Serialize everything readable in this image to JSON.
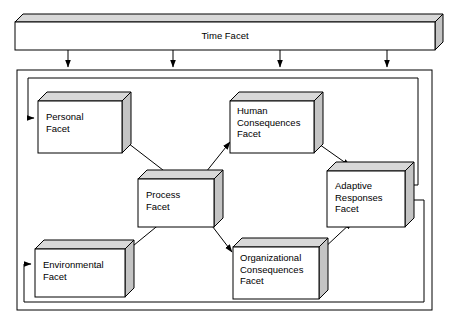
{
  "diagram": {
    "title": "Time Facet",
    "type": "block-diagram",
    "time_bar": {
      "label": "Time Facet",
      "x": 15,
      "y": 14,
      "w": 420,
      "h": 28,
      "depth": 8
    },
    "container": {
      "name": "outer-frame",
      "x": 17,
      "y": 70,
      "w": 415,
      "h": 240
    },
    "boxes": [
      {
        "id": "personal-facet",
        "label": "Personal\nFacet",
        "lines": [
          "Personal",
          "Facet"
        ],
        "x": 38,
        "y": 92,
        "w": 84,
        "h": 52,
        "depth": 9
      },
      {
        "id": "human-consequences-facet",
        "label": "Human\nConsequences\nFacet",
        "lines": [
          "Human",
          "Consequences",
          "Facet"
        ],
        "x": 230,
        "y": 92,
        "w": 84,
        "h": 52,
        "depth": 9
      },
      {
        "id": "process-facet",
        "label": "Process\nFacet",
        "lines": [
          "Process",
          "Facet"
        ],
        "x": 138,
        "y": 170,
        "w": 76,
        "h": 48,
        "depth": 9
      },
      {
        "id": "adaptive-responses-facet",
        "label": "Adaptive\nResponses\nFacet",
        "lines": [
          "Adaptive",
          "Responses",
          "Facet"
        ],
        "x": 327,
        "y": 162,
        "w": 78,
        "h": 56,
        "depth": 9
      },
      {
        "id": "environmental-facet",
        "label": "Environmental\nFacet",
        "lines": [
          "Environmental",
          "Facet"
        ],
        "x": 35,
        "y": 240,
        "w": 90,
        "h": 48,
        "depth": 9
      },
      {
        "id": "organizational-consequences-facet",
        "label": "Organizational\nConsequences\nFacet",
        "lines": [
          "Organizational",
          "Consequences",
          "Facet"
        ],
        "x": 233,
        "y": 238,
        "w": 86,
        "h": 52,
        "depth": 9
      }
    ],
    "time_arrows": [
      {
        "name": "time-arrow-1",
        "x": 68
      },
      {
        "name": "time-arrow-2",
        "x": 173
      },
      {
        "name": "time-arrow-3",
        "x": 280
      },
      {
        "name": "time-arrow-4",
        "x": 387
      }
    ],
    "connections": [
      {
        "name": "personal-to-process",
        "from": "personal-facet",
        "to": "process-facet"
      },
      {
        "name": "environmental-to-process",
        "from": "environmental-facet",
        "to": "process-facet"
      },
      {
        "name": "process-to-human-consequences",
        "from": "process-facet",
        "to": "human-consequences-facet"
      },
      {
        "name": "process-to-organizational-consequences",
        "from": "process-facet",
        "to": "organizational-consequences-facet"
      },
      {
        "name": "human-consequences-to-adaptive-responses",
        "from": "human-consequences-facet",
        "to": "adaptive-responses-facet"
      },
      {
        "name": "organizational-consequences-to-adaptive-responses",
        "from": "organizational-consequences-facet",
        "to": "adaptive-responses-facet"
      },
      {
        "name": "feedback-to-personal",
        "from": "adaptive-responses-facet",
        "to": "personal-facet"
      },
      {
        "name": "feedback-to-environmental",
        "from": "adaptive-responses-facet",
        "to": "environmental-facet"
      }
    ],
    "colors": {
      "stroke": "#000000",
      "box_fill": "#ffffff",
      "face_top": "#d8d8d8",
      "face_side": "#c4c4c4",
      "background": "#ffffff"
    }
  }
}
